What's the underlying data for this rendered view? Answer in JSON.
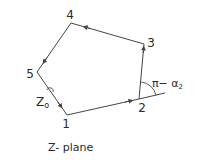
{
  "diagram": {
    "title": "Z- plane",
    "vertices": [
      {
        "id": "1",
        "label": "1"
      },
      {
        "id": "2",
        "label": "2"
      },
      {
        "id": "3",
        "label": "3"
      },
      {
        "id": "4",
        "label": "4"
      },
      {
        "id": "5",
        "label": "5"
      }
    ],
    "edges": [
      {
        "from": "1",
        "to": "2",
        "direction": "forward"
      },
      {
        "from": "2",
        "to": "3",
        "direction": "forward"
      },
      {
        "from": "3",
        "to": "4",
        "direction": "forward"
      },
      {
        "from": "4",
        "to": "5",
        "direction": "forward"
      },
      {
        "from": "5",
        "to": "1",
        "direction": "forward"
      }
    ],
    "point_label": "Z",
    "point_label_sub": "o",
    "angle_label": "π− α",
    "angle_label_sub": "2",
    "line_color": "#444444",
    "text_color": "#2a2a2a"
  }
}
